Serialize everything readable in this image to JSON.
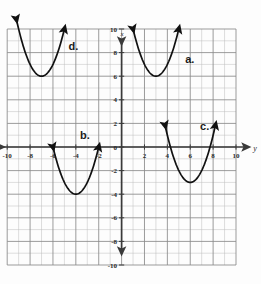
{
  "figure": {
    "title": "",
    "background_color": "#fdfdfd",
    "curve_color": "#111111",
    "axis_color": "#3a3a3a",
    "grid_major_color": "#8a8a8a",
    "grid_minor_color": "#bcbcbc"
  },
  "chart_data": {
    "type": "line",
    "title": "",
    "xlabel": "y",
    "ylabel": "x",
    "xlim": [
      -10,
      10
    ],
    "ylim": [
      -10,
      10
    ],
    "grid": true,
    "grid_minor_step": 1,
    "grid_major_step": 2,
    "legend": "none",
    "x_tick_labels": [
      "-10",
      "-8",
      "-6",
      "-4",
      "-2",
      "0",
      "2",
      "4",
      "6",
      "8",
      "10"
    ],
    "x_tick_values": [
      -10,
      -8,
      -6,
      -4,
      -2,
      0,
      2,
      4,
      6,
      8,
      10
    ],
    "y_tick_labels": [
      "-10",
      "-8",
      "-6",
      "-4",
      "-2",
      "0",
      "2",
      "4",
      "6",
      "8",
      "10"
    ],
    "y_tick_values": [
      -10,
      -8,
      -6,
      -4,
      -2,
      0,
      2,
      4,
      6,
      8,
      10
    ],
    "axis_arrows": [
      "up",
      "down",
      "left",
      "right"
    ],
    "series": [
      {
        "name": "a",
        "label": "a.",
        "label_x": 6.0,
        "label_y": 7.4,
        "vertex": [
          3,
          6
        ],
        "opens": "up",
        "a_coefficient": 1,
        "x_start": 1.0,
        "x_end": 5.0,
        "arrow_ends": [
          "start",
          "end"
        ]
      },
      {
        "name": "b",
        "label": "b.",
        "label_x": -3.2,
        "label_y": 0.9,
        "vertex": [
          -4,
          -4
        ],
        "opens": "up",
        "a_coefficient": 1,
        "x_start": -6.0,
        "x_end": -2.0,
        "arrow_ends": [
          "start",
          "end"
        ]
      },
      {
        "name": "c",
        "label": "c.",
        "label_x": 7.3,
        "label_y": 1.7,
        "vertex": [
          6,
          -3
        ],
        "opens": "up",
        "a_coefficient": 1,
        "x_start": 3.8,
        "x_end": 8.2,
        "arrow_ends": [
          "start",
          "end"
        ]
      },
      {
        "name": "d",
        "label": "d.",
        "label_x": -4.2,
        "label_y": 8.5,
        "vertex": [
          -7,
          6
        ],
        "opens": "up",
        "a_coefficient": 1,
        "x_start": -9.2,
        "x_end": -5.0,
        "arrow_ends": [
          "start",
          "end"
        ]
      }
    ]
  }
}
